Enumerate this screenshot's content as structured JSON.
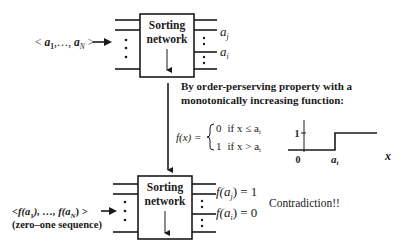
{
  "top_network": {
    "label_line1": "Sorting",
    "label_line2": "network",
    "input_label": "< a1,…, aN >",
    "input_label_parts": {
      "open": "< ",
      "a1_base": "a",
      "a1_sub": "1",
      "sep": ",…, ",
      "aN_base": "a",
      "aN_sub": "N",
      "close": " >"
    },
    "output_labels": [
      {
        "base": "a",
        "sub": "j"
      },
      {
        "base": "a",
        "sub": "i"
      }
    ]
  },
  "explanation": {
    "line1": "By order-perserving property with a",
    "line2": "monotonically increasing function:"
  },
  "formula": {
    "lhs": "f(x) =",
    "case1_value": "0",
    "case1_cond": "if x ≤ a",
    "case1_sub": "i",
    "case2_value": "1",
    "case2_cond": "if x > a",
    "case2_sub": "i"
  },
  "step_plot": {
    "y_tick_label": "1",
    "origin_label": "0",
    "x_tick_base": "a",
    "x_tick_sub": "i",
    "x_axis_label": "x"
  },
  "bottom_network": {
    "label_line1": "Sorting",
    "label_line2": "network",
    "input_label_line1": "<f(a1), …, f(aN) >",
    "input_label_parts": {
      "open": "<f(",
      "a1_base": "a",
      "a1_sub": "1",
      "mid": "), …, f(",
      "aN_base": "a",
      "aN_sub": "N",
      "close": ") >"
    },
    "input_label_line2": "(zero–one sequence)",
    "output_labels": [
      {
        "prefix": "f(",
        "base": "a",
        "sub": "j",
        "suffix": ") = 1"
      },
      {
        "prefix": "f(",
        "base": "a",
        "sub": "i",
        "suffix": ") = 0"
      }
    ],
    "conclusion": "Contradiction!!"
  }
}
